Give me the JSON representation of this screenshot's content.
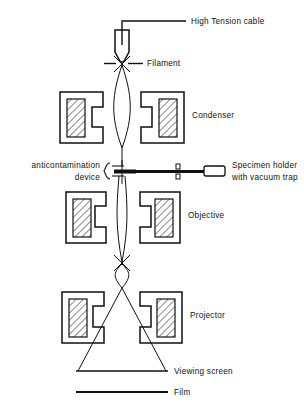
{
  "diagram": {
    "background_color": "#ffffff",
    "line_color": "#111111",
    "labels": {
      "high_tension_cable": "High Tension cable",
      "filament": "Filament",
      "condenser": "Condenser",
      "anticontamination_line1": "anticontamination",
      "anticontamination_line2": "device",
      "specimen_holder_line1": "Specimen holder",
      "specimen_holder_line2": "with vacuum trap",
      "objective": "Objective",
      "projector": "Projector",
      "viewing_screen": "Viewing screen",
      "film": "Film"
    },
    "components": [
      {
        "name": "electron-gun",
        "label": "High Tension cable"
      },
      {
        "name": "filament",
        "label": "Filament"
      },
      {
        "name": "condenser-lens",
        "label": "Condenser"
      },
      {
        "name": "anticontamination-device",
        "label": "anticontamination device"
      },
      {
        "name": "specimen-holder",
        "label": "Specimen holder with vacuum trap"
      },
      {
        "name": "objective-lens",
        "label": "Objective"
      },
      {
        "name": "projector-lens",
        "label": "Projector"
      },
      {
        "name": "viewing-screen",
        "label": "Viewing screen"
      },
      {
        "name": "film",
        "label": "Film"
      }
    ]
  }
}
